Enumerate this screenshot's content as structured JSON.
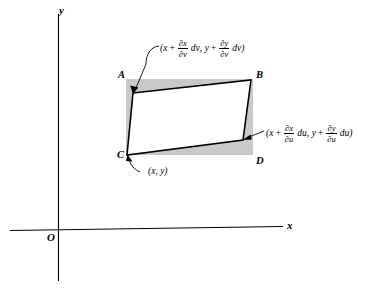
{
  "figure": {
    "title_alt": "Jacobian area element diagram",
    "background_color": "#ffffff",
    "line_color": "#000000",
    "shade_color": "#c9c9c9"
  },
  "axes": {
    "x_label": "x",
    "y_label": "y",
    "origin_label": "O"
  },
  "rectangle": {
    "corners": [
      {
        "id": "A",
        "label": "A",
        "position": "top-left"
      },
      {
        "id": "B",
        "label": "B",
        "position": "top-right"
      },
      {
        "id": "C",
        "label": "C",
        "position": "bottom-left"
      },
      {
        "id": "D",
        "label": "D",
        "position": "bottom-right"
      }
    ]
  },
  "annotations": {
    "base_point": {
      "text": "(x, y)",
      "target": "C"
    },
    "v_direction": {
      "open_paren": "(",
      "x_var": "x",
      "plus": "+",
      "frac1_num": "∂x",
      "frac1_den": "∂v",
      "diff1": "dv",
      "comma": ",",
      "y_var": "y",
      "plus2": "+",
      "frac2_num": "∂y",
      "frac2_den": "∂v",
      "diff2": "dv",
      "close_paren": ")"
    },
    "u_direction": {
      "open_paren": "(",
      "x_var": "x",
      "plus": "+",
      "frac1_num": "∂x",
      "frac1_den": "∂u",
      "diff1": "du",
      "comma": ",",
      "y_var": "y",
      "plus2": "+",
      "frac2_num": "∂y",
      "frac2_den": "∂u",
      "diff2": "du",
      "close_paren": ")"
    }
  }
}
